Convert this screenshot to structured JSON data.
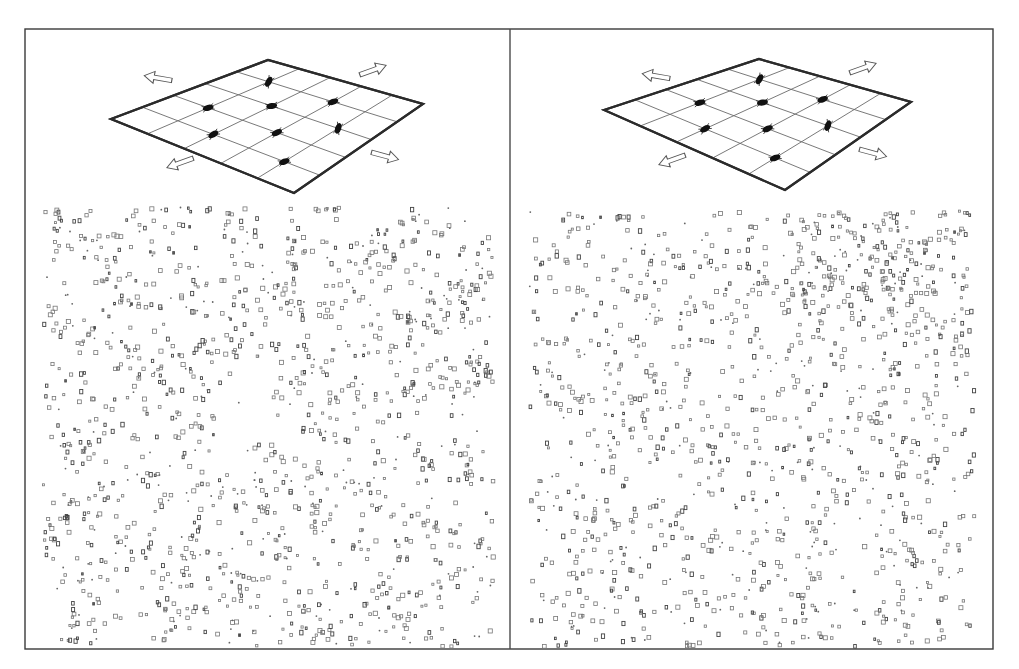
{
  "figure": {
    "canvas": {
      "width": 1019,
      "height": 669,
      "background": "#ffffff"
    },
    "frame": {
      "x": 25,
      "y": 29,
      "width": 968,
      "height": 620,
      "color": "#3a3a3a"
    },
    "divider_x": 510,
    "panels": [
      {
        "id": "left",
        "description": "Stretched grid with tracked particles; radial flow field pattern below",
        "grid": {
          "corners": {
            "left": [
              111,
              119
            ],
            "top": [
              268,
              60
            ],
            "right": [
              423,
              104
            ],
            "bottom": [
              294,
              193
            ]
          },
          "divisions": 5
        },
        "insects": [
          {
            "u": 0.2,
            "v": 0.8,
            "angle": -20
          },
          {
            "u": 0.4,
            "v": 0.6,
            "angle": -25
          },
          {
            "u": 0.2,
            "v": 0.4,
            "angle": -30
          },
          {
            "u": 0.6,
            "v": 0.4,
            "angle": -10
          },
          {
            "u": 0.4,
            "v": 0.2,
            "angle": -15
          },
          {
            "u": 0.8,
            "v": 0.2,
            "angle": -60
          },
          {
            "u": 0.8,
            "v": 0.6,
            "angle": -20
          },
          {
            "u": 0.6,
            "v": 0.8,
            "angle": -70
          }
        ],
        "arrows": [
          {
            "name": "arrow-upper-left",
            "x": 158,
            "y": 78,
            "angle": 190
          },
          {
            "name": "arrow-upper-right",
            "x": 373,
            "y": 70,
            "angle": -20
          },
          {
            "name": "arrow-lower-left",
            "x": 180,
            "y": 163,
            "angle": 160
          },
          {
            "name": "arrow-lower-right",
            "x": 385,
            "y": 156,
            "angle": 15
          }
        ],
        "particles": {
          "region": {
            "x": 42,
            "y": 205,
            "width": 450,
            "height": 440
          },
          "count": 1300,
          "pattern": "radial",
          "center": [
            235,
            420
          ],
          "seed": 17
        }
      },
      {
        "id": "right",
        "description": "Stretched grid with tracked particles; diffuse flow field pattern below",
        "grid": {
          "corners": {
            "left": [
              604,
              110
            ],
            "top": [
              759,
              59
            ],
            "right": [
              911,
              102
            ],
            "bottom": [
              785,
              190
            ]
          },
          "divisions": 5
        },
        "insects": [
          {
            "u": 0.2,
            "v": 0.8,
            "angle": -20
          },
          {
            "u": 0.4,
            "v": 0.6,
            "angle": -25
          },
          {
            "u": 0.2,
            "v": 0.4,
            "angle": -30
          },
          {
            "u": 0.6,
            "v": 0.4,
            "angle": -10
          },
          {
            "u": 0.4,
            "v": 0.2,
            "angle": -15
          },
          {
            "u": 0.8,
            "v": 0.2,
            "angle": -60
          },
          {
            "u": 0.8,
            "v": 0.6,
            "angle": -20
          },
          {
            "u": 0.6,
            "v": 0.8,
            "angle": -70
          }
        ],
        "arrows": [
          {
            "name": "arrow-upper-left",
            "x": 656,
            "y": 76,
            "angle": 190
          },
          {
            "name": "arrow-upper-right",
            "x": 863,
            "y": 68,
            "angle": -20
          },
          {
            "name": "arrow-lower-left",
            "x": 672,
            "y": 160,
            "angle": 160
          },
          {
            "name": "arrow-lower-right",
            "x": 873,
            "y": 153,
            "angle": 15
          }
        ],
        "particles": {
          "region": {
            "x": 528,
            "y": 210,
            "width": 445,
            "height": 435
          },
          "count": 1250,
          "pattern": "diffuse",
          "center": [
            880,
            250
          ],
          "seed": 41
        }
      }
    ]
  }
}
